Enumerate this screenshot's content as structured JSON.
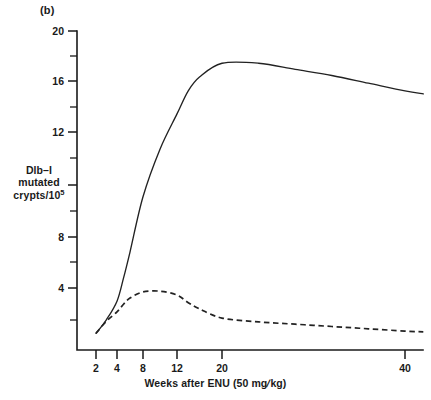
{
  "panel": {
    "label": "(b)"
  },
  "axis_titles": {
    "y_line1": "Dlb–I",
    "y_line2": "mutated",
    "y_line3": "crypts/10",
    "y_exponent": "5",
    "x_part1": "Weeks after ENU (50 mg",
    "x_slash": "/",
    "x_part2": "kg)"
  },
  "ticks": {
    "y_major": [
      "4",
      "8",
      "12",
      "16",
      "20"
    ],
    "y_minor": [
      "2",
      "6",
      "10",
      "14",
      "18"
    ],
    "x_major": [
      "2",
      "4",
      "8",
      "12",
      "20",
      "40"
    ]
  },
  "chart_data": {
    "type": "line",
    "title": "(b)",
    "xlabel": "Weeks after ENU (50 mg/kg)",
    "ylabel": "Dlb-I mutated crypts/10^5",
    "xlim": [
      1,
      44
    ],
    "ylim": [
      0,
      20
    ],
    "x_scale": "nonlinear-compressed",
    "grid": false,
    "legend": "none",
    "x_tick_values": [
      2,
      4,
      8,
      12,
      20,
      40
    ],
    "y_tick_values_major": [
      4,
      8,
      12,
      16,
      20
    ],
    "y_tick_values_minor": [
      2,
      6,
      10,
      14,
      18
    ],
    "series": [
      {
        "name": "solid curve",
        "style": "solid",
        "color": "#222222",
        "x": [
          2,
          3,
          4,
          5,
          6,
          8,
          10,
          12,
          14,
          16,
          20,
          24,
          28,
          32,
          36,
          40,
          42
        ],
        "y": [
          0.3,
          1.2,
          2.4,
          3.9,
          5.6,
          9.2,
          12.3,
          14.6,
          16.1,
          17.0,
          17.9,
          17.9,
          17.5,
          17.1,
          16.6,
          16.1,
          15.9
        ]
      },
      {
        "name": "dashed curve",
        "style": "dashed",
        "color": "#222222",
        "x": [
          2,
          3,
          4,
          5,
          6,
          8,
          10,
          12,
          14,
          16,
          20,
          24,
          28,
          32,
          36,
          40,
          42
        ],
        "y": [
          0.3,
          1.1,
          1.7,
          2.2,
          2.6,
          3.0,
          3.05,
          2.8,
          2.3,
          1.9,
          1.3,
          1.05,
          0.9,
          0.75,
          0.6,
          0.45,
          0.4
        ]
      }
    ],
    "annotations": [
      {
        "text": "(b)",
        "position": "top-left"
      }
    ]
  }
}
